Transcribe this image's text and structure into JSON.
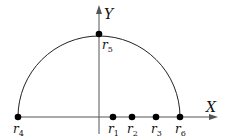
{
  "diagram": {
    "axes": {
      "x_label": "X",
      "y_label": "Y",
      "origin": [
        99,
        117
      ],
      "x_end": 218,
      "y_top": 5
    },
    "semicircle": {
      "center": [
        99,
        117
      ],
      "radius": 81
    },
    "points": [
      {
        "id": "r1",
        "base": "r",
        "sub": "1",
        "x": 113,
        "y": 117,
        "label_pos": "below"
      },
      {
        "id": "r2",
        "base": "r",
        "sub": "2",
        "x": 132,
        "y": 117,
        "label_pos": "below"
      },
      {
        "id": "r3",
        "base": "r",
        "sub": "3",
        "x": 156,
        "y": 117,
        "label_pos": "below"
      },
      {
        "id": "r4",
        "base": "r",
        "sub": "4",
        "x": 18,
        "y": 117,
        "label_pos": "below"
      },
      {
        "id": "r5",
        "base": "r",
        "sub": "5",
        "x": 99,
        "y": 34,
        "label_pos": "below-right"
      },
      {
        "id": "r6",
        "base": "r",
        "sub": "6",
        "x": 180,
        "y": 117,
        "label_pos": "below"
      }
    ],
    "colors": {
      "stroke": "#222222",
      "point": "#000000",
      "axis": "#555555"
    }
  }
}
